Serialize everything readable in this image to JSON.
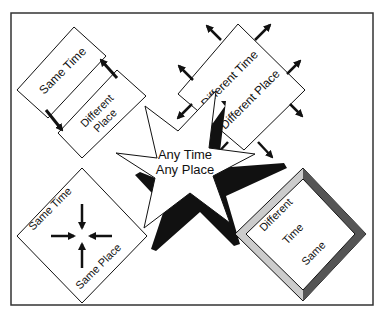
{
  "diagram": {
    "center": {
      "line1": "Any Time",
      "line2": "Any Place"
    },
    "top_left": {
      "label1": "Same Time",
      "label2a": "Different",
      "label2b": "Place"
    },
    "top_right": {
      "label1": "Different Time",
      "label2": "Different Place"
    },
    "bottom_left": {
      "label1": "Same Time",
      "label2": "Same Place"
    },
    "bottom_right": {
      "label1": "Different",
      "label2": "Time",
      "label3": "Same"
    }
  },
  "colors": {
    "stroke": "#111111",
    "fill": "#ffffff",
    "bevel_dark": "#555555",
    "bevel_light": "#cccccc"
  }
}
